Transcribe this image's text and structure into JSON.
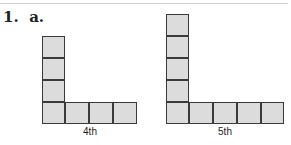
{
  "problem": {
    "number": "1.",
    "part": "a."
  },
  "figures": [
    {
      "caption": "4th",
      "term": 4,
      "vertical_squares": 4,
      "horizontal_squares": 4,
      "total_squares": 7,
      "fill_color": "#dcdcdc",
      "stroke_color": "#3a3a3a"
    },
    {
      "caption": "5th",
      "term": 5,
      "vertical_squares": 5,
      "horizontal_squares": 5,
      "total_squares": 9,
      "fill_color": "#dcdcdc",
      "stroke_color": "#3a3a3a"
    }
  ]
}
